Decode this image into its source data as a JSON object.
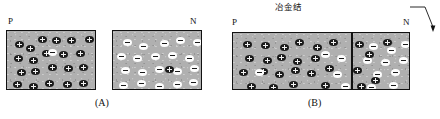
{
  "figure": {
    "title_hidden": "",
    "colors": {
      "block_fill": "#b0b0b0",
      "outline": "#111111",
      "positive_carrier": "#1a1a1a",
      "negative_carrier": "#fdfdfd"
    }
  },
  "panel_a": {
    "caption": "(A)",
    "p_label": "P",
    "n_label": "N",
    "p_block": {
      "majority_carrier": "+",
      "minority_carrier": "-",
      "positive_count": 21,
      "negative_count": 1,
      "positives": [
        [
          8,
          10
        ],
        [
          19,
          14
        ],
        [
          31,
          5
        ],
        [
          45,
          6
        ],
        [
          60,
          6
        ],
        [
          78,
          5
        ],
        [
          7,
          24
        ],
        [
          22,
          26
        ],
        [
          35,
          19
        ],
        [
          52,
          20
        ],
        [
          69,
          19
        ],
        [
          10,
          38
        ],
        [
          24,
          37
        ],
        [
          41,
          33
        ],
        [
          57,
          34
        ],
        [
          72,
          33
        ],
        [
          6,
          50
        ],
        [
          22,
          52
        ],
        [
          38,
          49
        ],
        [
          56,
          50
        ],
        [
          72,
          49
        ]
      ],
      "negatives": [
        [
          41,
          18
        ]
      ]
    },
    "n_block": {
      "majority_carrier": "-",
      "minority_carrier": "+",
      "negative_count": 21,
      "positive_count": 1,
      "negatives": [
        [
          10,
          8
        ],
        [
          26,
          12
        ],
        [
          47,
          9
        ],
        [
          63,
          6
        ],
        [
          80,
          8
        ],
        [
          4,
          22
        ],
        [
          20,
          24
        ],
        [
          38,
          22
        ],
        [
          55,
          21
        ],
        [
          72,
          24
        ],
        [
          8,
          36
        ],
        [
          25,
          38
        ],
        [
          42,
          35
        ],
        [
          60,
          37
        ],
        [
          77,
          34
        ],
        [
          6,
          51
        ],
        [
          24,
          49
        ],
        [
          42,
          52
        ],
        [
          60,
          50
        ],
        [
          76,
          48
        ],
        [
          88,
          18
        ]
      ],
      "positives": [
        [
          52,
          35
        ]
      ]
    }
  },
  "panel_b": {
    "caption": "(B)",
    "p_label": "P",
    "n_label": "N",
    "callout": "冶金结",
    "callout_meaning_hidden": "",
    "p_side": {
      "majority_carrier": "+",
      "minority_carrier": "-",
      "positives": [
        [
          10,
          8
        ],
        [
          28,
          9
        ],
        [
          47,
          11
        ],
        [
          62,
          6
        ],
        [
          80,
          11
        ],
        [
          96,
          6
        ],
        [
          12,
          22
        ],
        [
          30,
          24
        ],
        [
          44,
          21
        ],
        [
          60,
          25
        ],
        [
          78,
          22
        ],
        [
          6,
          36
        ],
        [
          26,
          35
        ],
        [
          42,
          38
        ],
        [
          58,
          34
        ],
        [
          74,
          37
        ],
        [
          92,
          32
        ],
        [
          14,
          50
        ],
        [
          36,
          51
        ],
        [
          56,
          48
        ],
        [
          88,
          49
        ]
      ],
      "negatives": [
        [
          88,
          18
        ],
        [
          104,
          22
        ],
        [
          100,
          38
        ],
        [
          22,
          36
        ],
        [
          108,
          50
        ]
      ]
    },
    "n_side": {
      "majority_carrier": "-",
      "minority_carrier": "+",
      "negatives": [
        [
          18,
          10
        ],
        [
          36,
          14
        ],
        [
          55,
          8
        ],
        [
          72,
          12
        ],
        [
          90,
          6
        ],
        [
          12,
          24
        ],
        [
          30,
          26
        ],
        [
          48,
          22
        ],
        [
          66,
          25
        ],
        [
          84,
          20
        ],
        [
          22,
          38
        ],
        [
          40,
          36
        ],
        [
          58,
          39
        ],
        [
          76,
          34
        ],
        [
          94,
          37
        ],
        [
          16,
          51
        ],
        [
          38,
          49
        ],
        [
          62,
          52
        ],
        [
          86,
          48
        ]
      ],
      "positives": [
        [
          4,
          8
        ],
        [
          14,
          18
        ],
        [
          32,
          6
        ],
        [
          2,
          34
        ],
        [
          20,
          44
        ],
        [
          6,
          50
        ]
      ]
    }
  }
}
